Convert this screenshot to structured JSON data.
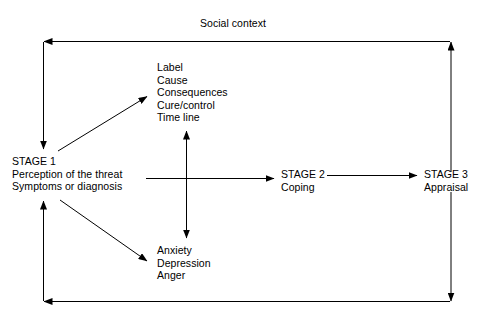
{
  "diagram": {
    "title": "Social context",
    "nodes": {
      "stage1": {
        "lines": [
          "STAGE 1",
          "Perception of the threat",
          "Symptoms or diagnosis"
        ]
      },
      "stage2": {
        "lines": [
          "STAGE 2",
          "Coping"
        ]
      },
      "stage3": {
        "lines": [
          "STAGE 3",
          "Appraisal"
        ]
      },
      "illness_representation": {
        "lines": [
          "Label",
          "Cause",
          "Consequences",
          "Cure/control",
          "Time line"
        ]
      },
      "emotional_response": {
        "lines": [
          "Anxiety",
          "Depression",
          "Anger"
        ]
      }
    },
    "colors": {
      "line": "#000000",
      "text": "#000000",
      "background": "#ffffff"
    }
  }
}
